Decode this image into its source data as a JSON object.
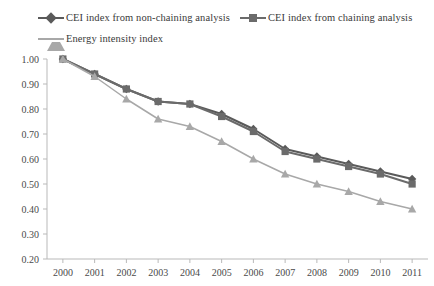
{
  "legend": {
    "entries": [
      {
        "label": "CEI index from non-chaining analysis",
        "marker": "diamond-marker-icon",
        "color": "#5a5a5a"
      },
      {
        "label": "CEI index from chaining analysis",
        "marker": "square-marker-icon",
        "color": "#6b6b6b"
      },
      {
        "label": "Energy intensity index",
        "marker": "triangle-marker-icon",
        "color": "#a8a8a8"
      }
    ]
  },
  "chart_data": {
    "type": "line",
    "title": "",
    "xlabel": "",
    "ylabel": "",
    "categories": [
      "2000",
      "2001",
      "2002",
      "2003",
      "2004",
      "2005",
      "2006",
      "2007",
      "2008",
      "2009",
      "2010",
      "2011"
    ],
    "x": [
      2000,
      2001,
      2002,
      2003,
      2004,
      2005,
      2006,
      2007,
      2008,
      2009,
      2010,
      2011
    ],
    "ylim": [
      0.2,
      1.0
    ],
    "yticks": [
      "0.20",
      "0.30",
      "0.40",
      "0.50",
      "0.60",
      "0.70",
      "0.80",
      "0.90",
      "1.00"
    ],
    "ytick_values": [
      0.2,
      0.3,
      0.4,
      0.5,
      0.6,
      0.7,
      0.8,
      0.9,
      1.0
    ],
    "grid": false,
    "legend_position": "top-left",
    "series": [
      {
        "name": "CEI index from non-chaining analysis",
        "color": "#5a5a5a",
        "marker": "diamond",
        "values": [
          1.0,
          0.94,
          0.88,
          0.83,
          0.82,
          0.78,
          0.72,
          0.64,
          0.61,
          0.58,
          0.55,
          0.52
        ]
      },
      {
        "name": "CEI index from chaining analysis",
        "color": "#6b6b6b",
        "marker": "square",
        "values": [
          1.0,
          0.94,
          0.88,
          0.83,
          0.82,
          0.77,
          0.71,
          0.63,
          0.6,
          0.57,
          0.54,
          0.5
        ]
      },
      {
        "name": "Energy intensity index",
        "color": "#a8a8a8",
        "marker": "triangle",
        "values": [
          1.0,
          0.93,
          0.84,
          0.76,
          0.73,
          0.67,
          0.6,
          0.54,
          0.5,
          0.47,
          0.43,
          0.4
        ]
      }
    ]
  }
}
